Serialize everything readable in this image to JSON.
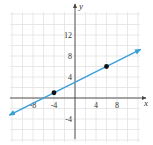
{
  "chart_data": {
    "type": "line",
    "title": "",
    "xlabel": "x",
    "ylabel": "y",
    "xlim": [
      -12,
      12
    ],
    "ylim": [
      -8,
      16
    ],
    "grid": true,
    "grid_step": 2,
    "x_ticks": [
      {
        "value": -8,
        "label": "-8"
      },
      {
        "value": -4,
        "label": "-4"
      },
      {
        "value": 4,
        "label": "4"
      },
      {
        "value": 8,
        "label": "8"
      }
    ],
    "y_ticks": [
      {
        "value": 12,
        "label": "12"
      },
      {
        "value": 8,
        "label": "8"
      },
      {
        "value": 4,
        "label": "4"
      },
      {
        "value": -4,
        "label": "-4"
      }
    ],
    "series": [
      {
        "name": "line",
        "equation": "y = 0.5x + 3",
        "slope": 0.5,
        "intercept": 3,
        "arrows_both_ends": true,
        "x_range": [
          -12.5,
          12.5
        ],
        "color": "#3a9fd8"
      }
    ],
    "points": [
      {
        "x": -4,
        "y": 1
      },
      {
        "x": 6,
        "y": 6
      }
    ]
  },
  "colors": {
    "line": "#3a9fd8",
    "grid": "#e2e2e2",
    "axis": "#444444",
    "point": "#111111"
  }
}
